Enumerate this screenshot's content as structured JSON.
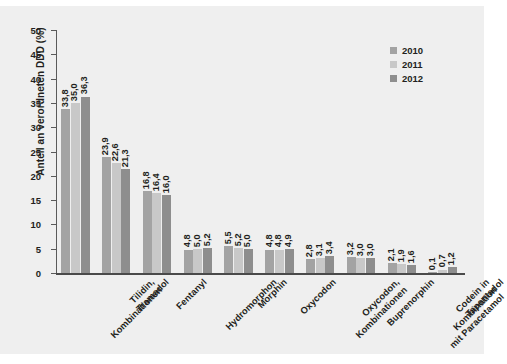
{
  "chart_data": {
    "type": "bar",
    "title": "",
    "xlabel": "",
    "ylabel": "Anteil an verordneten DDD (%)",
    "ylim": [
      0,
      50
    ],
    "ytick_labels": [
      "50",
      "45",
      "40",
      "35",
      "30",
      "25",
      "20",
      "15",
      "10",
      "5",
      "0"
    ],
    "ytick_values": [
      50,
      45,
      40,
      35,
      30,
      25,
      20,
      15,
      10,
      5,
      0
    ],
    "grid": false,
    "legend_position": "top-right",
    "decimal_separator": ",",
    "categories": [
      "Tilidin,\nKombinationen",
      "Tramadol",
      "Fentanyl",
      "Hydromorphon",
      "Morphin",
      "Oxycodon",
      "Oxycodon,\nKombinationen",
      "Buprenorphin",
      "Codein in Kombination\nmit Paracetamol",
      "Tapentadol"
    ],
    "series": [
      {
        "name": "2010",
        "color": "#a3a3a3",
        "values": [
          33.8,
          23.9,
          16.8,
          4.8,
          5.5,
          4.8,
          2.8,
          3.2,
          2.1,
          0.1
        ],
        "labels": [
          "33,8",
          "23,9",
          "16,8",
          "4,8",
          "5,5",
          "4,8",
          "2,8",
          "3,2",
          "2,1",
          "0,1"
        ]
      },
      {
        "name": "2011",
        "color": "#c8c8c8",
        "values": [
          35.0,
          22.6,
          16.4,
          5.0,
          5.2,
          4.8,
          3.1,
          3.0,
          1.9,
          0.7
        ],
        "labels": [
          "35,0",
          "22,6",
          "16,4",
          "5,0",
          "5,2",
          "4,8",
          "3,1",
          "3,0",
          "1,9",
          "0,7"
        ]
      },
      {
        "name": "2012",
        "color": "#8e8e8e",
        "values": [
          36.3,
          21.3,
          16.0,
          5.2,
          5.0,
          4.9,
          3.4,
          3.0,
          1.6,
          1.2
        ],
        "labels": [
          "36,3",
          "21,3",
          "16,0",
          "5,2",
          "5,0",
          "4,9",
          "3,4",
          "3,0",
          "1,6",
          "1,2"
        ]
      }
    ]
  },
  "legend": {
    "items": [
      {
        "label": "2010"
      },
      {
        "label": "2011"
      },
      {
        "label": "2012"
      }
    ]
  },
  "colors": {
    "series_2010": "#a3a3a3",
    "series_2011": "#c8c8c8",
    "series_2012": "#8e8e8e",
    "figure_background": "#efefef",
    "page_background": "#ffffff",
    "text": "#231f20",
    "axis": "#5a5a5a"
  }
}
